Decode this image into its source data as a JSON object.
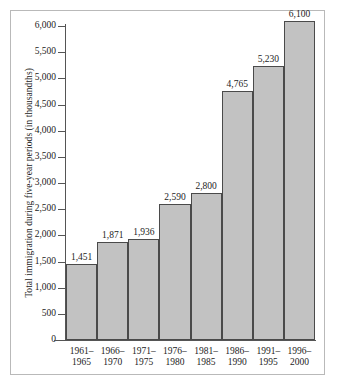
{
  "chart_data": {
    "type": "bar",
    "title": "",
    "xlabel": "",
    "ylabel": "Total immigration during five-year periods (in thousandths)",
    "ylim": [
      0,
      6000
    ],
    "ytick_step": 500,
    "grid": false,
    "legend": null,
    "categories": [
      "1961–1965",
      "1966–1970",
      "1971–1975",
      "1976–1980",
      "1981–1985",
      "1986–1990",
      "1991–1995",
      "1996–2000"
    ],
    "category_lines": [
      {
        "top": "1961–",
        "bottom": "1965"
      },
      {
        "top": "1966–",
        "bottom": "1970"
      },
      {
        "top": "1971–",
        "bottom": "1975"
      },
      {
        "top": "1976–",
        "bottom": "1980"
      },
      {
        "top": "1981–",
        "bottom": "1985"
      },
      {
        "top": "1986–",
        "bottom": "1990"
      },
      {
        "top": "1991–",
        "bottom": "1995"
      },
      {
        "top": "1996–",
        "bottom": "2000"
      }
    ],
    "values": [
      1451,
      1871,
      1936,
      2590,
      2800,
      4765,
      5230,
      6100
    ],
    "value_labels": [
      "1,451",
      "1,871",
      "1,936",
      "2,590",
      "2,800",
      "4,765",
      "5,230",
      "6,100"
    ],
    "ytick_values": [
      0,
      500,
      1000,
      1500,
      2000,
      2500,
      3000,
      3500,
      4000,
      4500,
      5000,
      5500,
      6000
    ],
    "ytick_labels": [
      "0",
      "500",
      "1,000",
      "1,500",
      "2,000",
      "2,500",
      "3,000",
      "3,500",
      "4,000",
      "4,500",
      "5,000",
      "5,500",
      "6,000"
    ],
    "colors": {
      "bar_fill": "#c2c2c2",
      "bar_border": "#4a4a4a",
      "axis": "#555555",
      "text": "#1c1c1c",
      "frame": "#b9b9b9",
      "background": "#ffffff"
    }
  }
}
